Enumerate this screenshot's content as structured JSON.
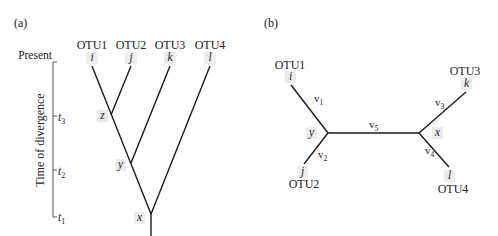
{
  "panel_a": {
    "label": "(a)",
    "present_label": "Present",
    "axis_label": "Time of divergence",
    "otus": [
      {
        "name": "OTU1",
        "leaf": "i"
      },
      {
        "name": "OTU2",
        "leaf": "j"
      },
      {
        "name": "OTU3",
        "leaf": "k"
      },
      {
        "name": "OTU4",
        "leaf": "l"
      }
    ],
    "nodes": {
      "z": "z",
      "y": "y",
      "x": "x"
    },
    "ticks": [
      {
        "name": "t",
        "sub": "3"
      },
      {
        "name": "t",
        "sub": "2"
      },
      {
        "name": "t",
        "sub": "1"
      }
    ]
  },
  "panel_b": {
    "label": "(b)",
    "otus": [
      {
        "name": "OTU1",
        "leaf": "i"
      },
      {
        "name": "OTU2",
        "leaf": "j"
      },
      {
        "name": "OTU3",
        "leaf": "k"
      },
      {
        "name": "OTU4",
        "leaf": "l"
      }
    ],
    "nodes": {
      "y": "y",
      "x": "x"
    },
    "branches": [
      {
        "name": "v",
        "sub": "1"
      },
      {
        "name": "v",
        "sub": "2"
      },
      {
        "name": "v",
        "sub": "3"
      },
      {
        "name": "v",
        "sub": "4"
      },
      {
        "name": "v",
        "sub": "5"
      }
    ]
  },
  "colors": {
    "line": "#1a1a1a",
    "text": "#222222",
    "label_bg": "#ececec"
  }
}
